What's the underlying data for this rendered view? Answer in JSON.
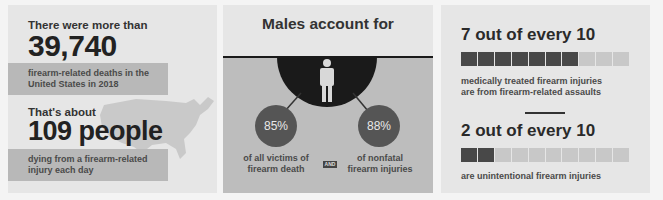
{
  "panel1": {
    "intro": "There were more than",
    "deaths": "39,740",
    "deaths_caption_line1": "firearm-related deaths in the",
    "deaths_caption_line2": "United States in 2018",
    "daily_intro": "That's about",
    "daily": "109 people",
    "daily_caption_line1": "dying from a firearm-related",
    "daily_caption_line2": "injury each day"
  },
  "panel2": {
    "title": "Males account for",
    "left_pct": "85%",
    "left_caption_line1": "of all victims of",
    "left_caption_line2": "firearm death",
    "and_label": "AND",
    "right_pct": "88%",
    "right_caption_line1": "of nonfatal",
    "right_caption_line2": "firearm injuries"
  },
  "panel3": {
    "stat1_heading": "7 out of every 10",
    "stat1_filled": 7,
    "stat1_caption_line1": "medically treated firearm injuries",
    "stat1_caption_line2": "are from firearm-related assaults",
    "stat2_heading": "2 out of every 10",
    "stat2_filled": 2,
    "stat2_caption_line1": "are unintentional firearm injuries"
  },
  "colors": {
    "panel_bg": "#e6e6e6",
    "band": "#b8b8b8",
    "dark": "#1a1a1a",
    "circle": "#555555",
    "block_on": "#484848",
    "block_off": "#c8c8c8"
  }
}
